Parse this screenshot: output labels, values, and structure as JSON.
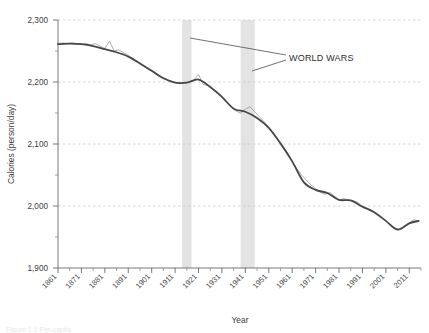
{
  "figure": {
    "background_color": "#ffffff",
    "caption_cropped": "Figure 1.1 Per-capita"
  },
  "chart_data": {
    "type": "line",
    "title": "",
    "xlabel": "Year",
    "ylabel": "Calories (person/day)",
    "xlim": [
      1861,
      2016
    ],
    "ylim": [
      1900,
      2300
    ],
    "y_ticks": [
      1900,
      2000,
      2100,
      2200,
      2300
    ],
    "y_tick_labels": [
      "1,900",
      "2,000",
      "2,100",
      "2,200",
      "2,300"
    ],
    "y_minor_ticks": [
      1950,
      2050,
      2150,
      2250
    ],
    "x_ticks": [
      1861,
      1871,
      1881,
      1891,
      1901,
      1911,
      1921,
      1931,
      1941,
      1951,
      1961,
      1971,
      1981,
      1991,
      2001,
      2011
    ],
    "x_tick_labels": [
      "1861",
      "1871",
      "1881",
      "1891",
      "1901",
      "1911",
      "1921",
      "1931",
      "1941",
      "1951",
      "1961",
      "1971",
      "1981",
      "1991",
      "2001",
      "2011"
    ],
    "x_minor_ticks": [
      1866,
      1876,
      1886,
      1896,
      1906,
      1916,
      1926,
      1936,
      1946,
      1956,
      1966,
      1976,
      1986,
      1996,
      2006,
      2016
    ],
    "grid": "horizontal-dashed",
    "grid_color": "#cfcfcf",
    "legend": "none",
    "series": [
      {
        "name": "annual",
        "style": "thin-jagged",
        "color": "#8d8d8d",
        "width": 0.7,
        "x": [
          1861,
          1863,
          1865,
          1867,
          1869,
          1871,
          1873,
          1875,
          1877,
          1879,
          1881,
          1883,
          1885,
          1887,
          1889,
          1891,
          1893,
          1895,
          1897,
          1899,
          1901,
          1903,
          1905,
          1907,
          1909,
          1911,
          1913,
          1915,
          1917,
          1919,
          1921,
          1923,
          1925,
          1927,
          1929,
          1931,
          1933,
          1935,
          1937,
          1939,
          1941,
          1943,
          1945,
          1947,
          1949,
          1951,
          1953,
          1955,
          1957,
          1959,
          1961,
          1963,
          1965,
          1967,
          1969,
          1971,
          1973,
          1975,
          1977,
          1979,
          1981,
          1983,
          1985,
          1987,
          1989,
          1991,
          1993,
          1995,
          1997,
          1999,
          2001,
          2003,
          2005,
          2007,
          2009,
          2011,
          2013,
          2015
        ],
        "y": [
          2262,
          2263,
          2262,
          2263,
          2262,
          2261,
          2262,
          2260,
          2262,
          2258,
          2254,
          2266,
          2250,
          2252,
          2247,
          2243,
          2238,
          2232,
          2228,
          2222,
          2218,
          2214,
          2209,
          2205,
          2202,
          2199,
          2197,
          2198,
          2200,
          2203,
          2212,
          2196,
          2194,
          2189,
          2183,
          2176,
          2168,
          2160,
          2153,
          2150,
          2156,
          2160,
          2152,
          2144,
          2136,
          2126,
          2116,
          2106,
          2096,
          2085,
          2072,
          2060,
          2050,
          2042,
          2034,
          2028,
          2022,
          2019,
          2022,
          2016,
          2009,
          2012,
          2010,
          2008,
          2006,
          1998,
          1996,
          1992,
          1988,
          1982,
          1976,
          1970,
          1964,
          1962,
          1966,
          1973,
          1978,
          1975
        ]
      },
      {
        "name": "smoothed-trend",
        "style": "thick-smooth",
        "color": "#474747",
        "width": 1.8,
        "x": [
          1861,
          1866,
          1871,
          1876,
          1881,
          1886,
          1891,
          1896,
          1901,
          1906,
          1911,
          1916,
          1921,
          1926,
          1931,
          1936,
          1941,
          1946,
          1951,
          1956,
          1961,
          1966,
          1971,
          1976,
          1981,
          1986,
          1991,
          1996,
          2001,
          2006,
          2011,
          2015
        ],
        "y": [
          2261,
          2262,
          2261,
          2258,
          2253,
          2248,
          2241,
          2230,
          2218,
          2206,
          2199,
          2199,
          2204,
          2192,
          2176,
          2157,
          2152,
          2142,
          2126,
          2101,
          2072,
          2038,
          2026,
          2021,
          2010,
          2009,
          1999,
          1990,
          1976,
          1962,
          1972,
          1976
        ]
      }
    ],
    "shaded_bands": [
      {
        "name": "world-war-1",
        "x_start": 1914,
        "x_end": 1918,
        "color": "#e3e3e3"
      },
      {
        "name": "world-war-2",
        "x_start": 1939,
        "x_end": 1945,
        "color": "#e3e3e3"
      }
    ],
    "annotations": [
      {
        "name": "world-wars-annotation",
        "text": "WORLD WARS",
        "text_x": 1982,
        "text_y": 2248,
        "leader_targets": [
          {
            "x": 1916,
            "y": 2266
          },
          {
            "x": 1942,
            "y": 2236
          }
        ]
      }
    ]
  }
}
